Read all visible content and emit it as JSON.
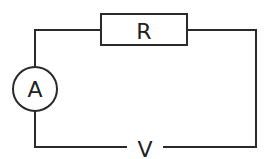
{
  "diagram": {
    "type": "circuit",
    "components": {
      "resistor": {
        "label": "R"
      },
      "ammeter": {
        "label": "A"
      },
      "supply": {
        "label": "V"
      }
    },
    "colors": {
      "wire": "#2a2a2a",
      "background": "#ffffff"
    }
  }
}
